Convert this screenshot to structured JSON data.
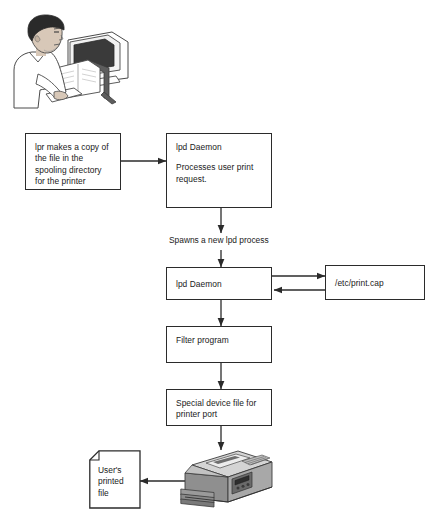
{
  "figure": {
    "kind": "flowchart"
  },
  "illustration": {
    "name": "user-at-computer-illustration",
    "description": "Man seated at a desk typing on a keyboard in front of a monitor with a document holder"
  },
  "nodes": [
    {
      "id": "lpr-copy",
      "label": "lpr makes a copy of\nthe file in the\nspooling directory\nfor the printer"
    },
    {
      "id": "lpd-daemon-1",
      "label": "lpd Daemon",
      "detail": "Processes user print\nrequest."
    },
    {
      "id": "lpd-daemon-2",
      "label": "lpd Daemon"
    },
    {
      "id": "print-cap",
      "label": "/etc/print.cap"
    },
    {
      "id": "filter-program",
      "label": "Filter program"
    },
    {
      "id": "special-device-file",
      "label": "Special device file for\nprinter port"
    }
  ],
  "labels": {
    "spawns": "Spawns a new lpd process"
  },
  "output_document": {
    "name": "users-printed-file",
    "label": "User's\nprinted\nfile"
  },
  "printer": {
    "name": "printer-illustration",
    "description": "Grey desktop laser printer with output tray and control panel"
  },
  "colors": {
    "stroke": "#2b2b2b",
    "box_fill": "#ffffff",
    "text": "#1a1a1a",
    "printer_body": "#a6a6a6",
    "printer_top": "#d4d4d4",
    "printer_shadow": "#6e6e6e",
    "skin": "#d8c8b8",
    "hair": "#2a2a2a",
    "screen": "#3a3a3a"
  }
}
